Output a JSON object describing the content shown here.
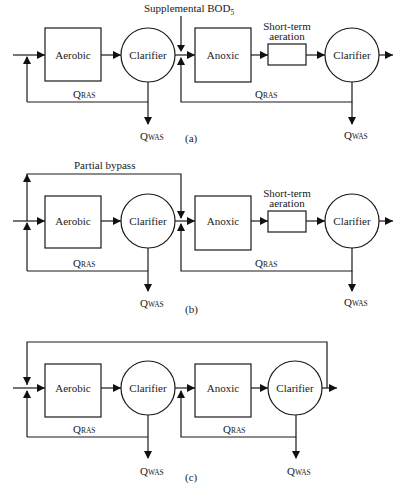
{
  "diagram": {
    "stroke_color": "#1a1a1a",
    "background": "#ffffff",
    "panels": [
      {
        "id": "a",
        "caption": "(a)",
        "top_label": "Supplemental BOD",
        "top_label_sub": "5",
        "units": {
          "aerobic": "Aerobic",
          "clarifier1": "Clarifier",
          "anoxic": "Anoxic",
          "short_term_aeration_line1": "Short-term",
          "short_term_aeration_line2": "aeration",
          "clarifier2": "Clarifier"
        },
        "flows": {
          "ras1": "Q",
          "ras1_sub": "RAS",
          "was1": "Q",
          "was1_sub": "WAS",
          "ras2": "Q",
          "ras2_sub": "RAS",
          "was2": "Q",
          "was2_sub": "WAS"
        }
      },
      {
        "id": "b",
        "caption": "(b)",
        "top_label": "Partial bypass",
        "units": {
          "aerobic": "Aerobic",
          "clarifier1": "Clarifier",
          "anoxic": "Anoxic",
          "short_term_aeration_line1": "Short-term",
          "short_term_aeration_line2": "aeration",
          "clarifier2": "Clarifier"
        },
        "flows": {
          "ras1": "Q",
          "ras1_sub": "RAS",
          "was1": "Q",
          "was1_sub": "WAS",
          "ras2": "Q",
          "ras2_sub": "RAS",
          "was2": "Q",
          "was2_sub": "WAS"
        }
      },
      {
        "id": "c",
        "caption": "(c)",
        "units": {
          "aerobic": "Aerobic",
          "clarifier1": "Clarifier",
          "anoxic": "Anoxic",
          "clarifier2": "Clarifier"
        },
        "flows": {
          "ras1": "Q",
          "ras1_sub": "RAS",
          "was1": "Q",
          "was1_sub": "WAS",
          "ras2": "Q",
          "ras2_sub": "RAS",
          "was2": "Q",
          "was2_sub": "WAS"
        }
      }
    ]
  }
}
